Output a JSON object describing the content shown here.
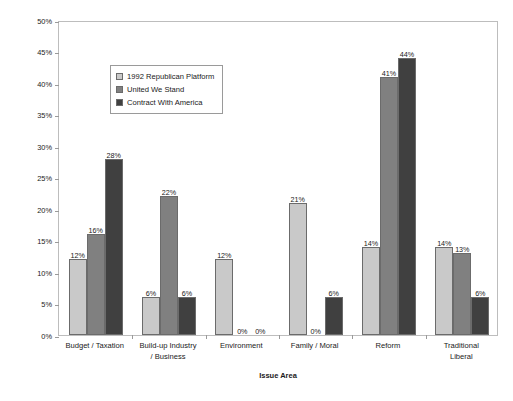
{
  "chart_data": {
    "type": "bar",
    "title": "",
    "xlabel": "Issue Area",
    "ylabel": "Percentage of Platform Dedicated to Issue Area",
    "ylim": [
      0,
      50
    ],
    "ytick_labels": [
      "0%",
      "5%",
      "10%",
      "15%",
      "20%",
      "25%",
      "30%",
      "35%",
      "40%",
      "45%",
      "50%"
    ],
    "ytick_values": [
      0,
      5,
      10,
      15,
      20,
      25,
      30,
      35,
      40,
      45,
      50
    ],
    "grid": false,
    "legend_position": "upper-left-inside",
    "categories": [
      "Budget / Taxation",
      "Build-up Industry / Business",
      "Environment",
      "Family / Moral",
      "Reform",
      "Traditional Liberal"
    ],
    "category_lines": [
      [
        "Budget / Taxation"
      ],
      [
        "Build-up Industry",
        "/ Business"
      ],
      [
        "Environment"
      ],
      [
        "Family / Moral"
      ],
      [
        "Reform"
      ],
      [
        "Traditional",
        "Liberal"
      ]
    ],
    "series": [
      {
        "name": "1992 Republican Platform",
        "color": "#c9c9c9",
        "values": [
          12,
          6,
          12,
          21,
          14,
          14
        ],
        "labels": [
          "12%",
          "6%",
          "12%",
          "21%",
          "14%",
          "14%"
        ]
      },
      {
        "name": "United We Stand",
        "color": "#808080",
        "values": [
          16,
          22,
          0,
          0,
          41,
          13
        ],
        "labels": [
          "16%",
          "22%",
          "0%",
          "0%",
          "41%",
          "13%"
        ]
      },
      {
        "name": "Contract With America",
        "color": "#404040",
        "values": [
          28,
          6,
          0,
          6,
          44,
          6
        ],
        "labels": [
          "28%",
          "6%",
          "0%",
          "6%",
          "44%",
          "6%"
        ]
      }
    ]
  },
  "legend": {
    "items": [
      {
        "label": "1992 Republican Platform",
        "color": "#c9c9c9"
      },
      {
        "label": "United We Stand",
        "color": "#808080"
      },
      {
        "label": "Contract With America",
        "color": "#404040"
      }
    ]
  },
  "axes": {
    "y_title": "Percentage of Platform Dedicated to Issue Area",
    "x_title": "Issue Area"
  }
}
